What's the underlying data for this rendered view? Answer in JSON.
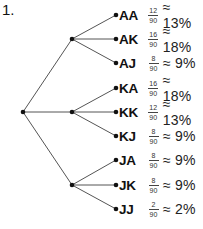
{
  "problem_number": "1.",
  "colors": {
    "line": "#555555",
    "node": "#111111",
    "text": "#111111"
  },
  "tree": {
    "root": {
      "x": 23,
      "y": 112
    },
    "branches": [
      {
        "label": "A",
        "x": 72,
        "y": 39,
        "leaves": [
          {
            "outcome": "AA",
            "numerator": "12",
            "denominator": "90",
            "percent": "≈ 13%",
            "x": 116,
            "y": 15
          },
          {
            "outcome": "AK",
            "numerator": "16",
            "denominator": "90",
            "percent": "≈ 18%",
            "x": 116,
            "y": 39
          },
          {
            "outcome": "AJ",
            "numerator": "8",
            "denominator": "90",
            "percent": "≈ 9%",
            "x": 116,
            "y": 63
          }
        ]
      },
      {
        "label": "K",
        "x": 72,
        "y": 112,
        "leaves": [
          {
            "outcome": "KA",
            "numerator": "16",
            "denominator": "90",
            "percent": "≈ 18%",
            "x": 116,
            "y": 88
          },
          {
            "outcome": "KK",
            "numerator": "12",
            "denominator": "90",
            "percent": "≈ 13%",
            "x": 116,
            "y": 112
          },
          {
            "outcome": "KJ",
            "numerator": "8",
            "denominator": "90",
            "percent": "≈ 9%",
            "x": 116,
            "y": 136
          }
        ]
      },
      {
        "label": "J",
        "x": 72,
        "y": 185,
        "leaves": [
          {
            "outcome": "JA",
            "numerator": "8",
            "denominator": "90",
            "percent": "≈ 9%",
            "x": 116,
            "y": 160
          },
          {
            "outcome": "JK",
            "numerator": "8",
            "denominator": "90",
            "percent": "≈ 9%",
            "x": 116,
            "y": 185
          },
          {
            "outcome": "JJ",
            "numerator": "2",
            "denominator": "90",
            "percent": "≈ 2%",
            "x": 116,
            "y": 209
          }
        ]
      }
    ]
  }
}
